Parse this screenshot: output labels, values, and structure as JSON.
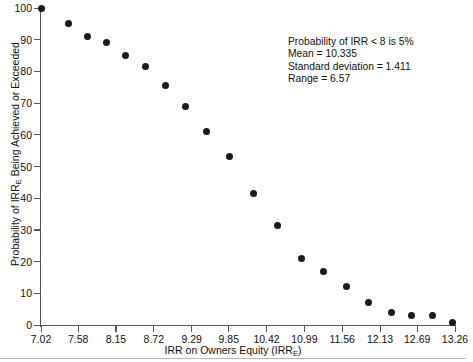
{
  "chart_data": {
    "type": "scatter",
    "title": "",
    "xlabel": "IRR on Owners Equity (IRRE)",
    "ylabel": "Probability of IRRE Being Achieved or Exceeded",
    "xlim": [
      7.02,
      13.26
    ],
    "ylim": [
      0,
      100
    ],
    "grid": false,
    "legend": "none",
    "x_ticks": [
      "7.02",
      "7.58",
      "8.15",
      "8.72",
      "9.29",
      "9.85",
      "10.42",
      "10.99",
      "11.56",
      "12.13",
      "12.69",
      "13.26"
    ],
    "x_tick_values": [
      7.02,
      7.58,
      8.15,
      8.72,
      9.29,
      9.85,
      10.42,
      10.99,
      11.56,
      12.13,
      12.69,
      13.26
    ],
    "y_ticks": [
      "0",
      "10",
      "20",
      "30",
      "40",
      "50",
      "60",
      "70",
      "80",
      "90",
      "100"
    ],
    "y_tick_values": [
      0,
      10,
      20,
      30,
      40,
      50,
      60,
      70,
      80,
      90,
      100
    ],
    "x": [
      7.02,
      7.44,
      7.72,
      8.0,
      8.3,
      8.6,
      8.9,
      9.2,
      9.52,
      9.86,
      10.22,
      10.58,
      10.94,
      11.28,
      11.62,
      11.96,
      12.3,
      12.6,
      12.92,
      13.22
    ],
    "values": [
      100,
      95,
      91,
      89,
      85,
      81.5,
      75.5,
      69,
      61,
      53,
      41.5,
      31.5,
      21,
      17,
      12,
      7,
      4,
      3,
      3,
      0.7
    ],
    "annotations": [
      "Probability of IRR < 8 is 5%",
      "Mean = 10.335",
      "Standard deviation = 1.411",
      "Range = 6.57"
    ]
  },
  "labels": {
    "y_axis_title_pre": "Probability of IRR",
    "y_axis_title_sub": "E",
    "y_axis_title_post": " Being Achieved or Exceeded",
    "x_axis_title_pre": "IRR on Owners Equity (IRR",
    "x_axis_title_sub": "E",
    "x_axis_title_post": ")"
  },
  "annotation": {
    "line1_pre": "Probability of IRR ",
    "line1_lt": "<",
    "line1_post": " 8 is 5%",
    "line2": "Mean = 10.335",
    "line3": "Standard deviation = 1.411",
    "line4": "Range = 6.57"
  },
  "colors": {
    "point": "#1a1a1a",
    "axis": "#555555",
    "text": "#111111",
    "rule": "#b9b9b9"
  }
}
